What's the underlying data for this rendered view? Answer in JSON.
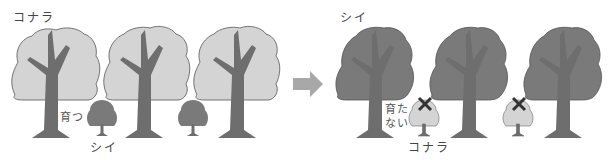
{
  "left_panel": {
    "title": "コナラ",
    "grow_label": "育つ",
    "sapling_label": "シイ"
  },
  "right_panel": {
    "title": "シイ",
    "not_grow_label_1": "育た",
    "not_grow_label_2": "ない",
    "sapling_label": "コナラ"
  },
  "colors": {
    "light_canopy": "#d4d4d4",
    "dark_canopy": "#7a7a7a",
    "trunk": "#6e6e6e",
    "outline": "#555555",
    "arrow": "#a8a8a8",
    "cross": "#333333"
  }
}
